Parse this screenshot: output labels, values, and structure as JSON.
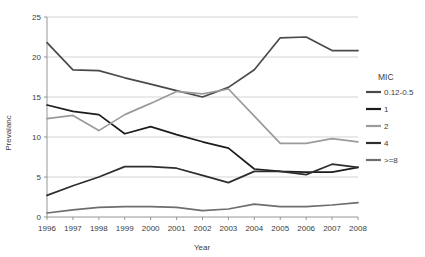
{
  "chart_data": {
    "type": "line",
    "title": "",
    "xlabel": "Year",
    "ylabel": "Prevalanc",
    "categories": [
      1996,
      1997,
      1998,
      1999,
      2000,
      2001,
      2002,
      2003,
      2004,
      2005,
      2006,
      2007,
      2008
    ],
    "x": [
      "1996",
      "1997",
      "1998",
      "1999",
      "2000",
      "2001",
      "2002",
      "2003",
      "2004",
      "2005",
      "2006",
      "2007",
      "2008"
    ],
    "ylim": [
      0,
      25
    ],
    "yticks": [
      0,
      5,
      10,
      15,
      20,
      25
    ],
    "ytick_labels": [
      "0",
      "5",
      "10",
      "15",
      "20",
      "25"
    ],
    "grid": "horizontal",
    "legend_position": "right",
    "legend_title": "MIC",
    "series": [
      {
        "name": "0.12-0.5",
        "color": "#4a4a4a",
        "values": [
          21.8,
          18.4,
          18.3,
          17.4,
          16.6,
          15.8,
          15.0,
          16.2,
          18.4,
          22.4,
          22.5,
          20.8,
          20.8
        ]
      },
      {
        "name": "1",
        "color": "#1c1c1c",
        "values": [
          14.0,
          13.2,
          12.8,
          10.4,
          11.3,
          10.3,
          9.4,
          8.6,
          6.0,
          5.7,
          5.6,
          5.6,
          6.2
        ]
      },
      {
        "name": "2",
        "color": "#9b9b9b",
        "values": [
          12.3,
          12.7,
          10.8,
          12.8,
          14.2,
          15.7,
          15.4,
          16.0,
          12.6,
          9.2,
          9.2,
          9.8,
          9.4
        ]
      },
      {
        "name": "4",
        "color": "#2e2e2e",
        "values": [
          2.7,
          3.9,
          5.0,
          6.3,
          6.3,
          6.1,
          5.2,
          4.3,
          5.7,
          5.7,
          5.3,
          6.6,
          6.2
        ]
      },
      {
        "name": ">=8",
        "color": "#6e6e6e",
        "values": [
          0.5,
          0.9,
          1.2,
          1.3,
          1.3,
          1.2,
          0.8,
          1.0,
          1.6,
          1.3,
          1.3,
          1.5,
          1.8
        ]
      }
    ]
  },
  "legend": {
    "title": "MIC",
    "items": [
      {
        "label": "0.12-0.5"
      },
      {
        "label": "1"
      },
      {
        "label": "2"
      },
      {
        "label": "4"
      },
      {
        "label": ">=8"
      }
    ]
  },
  "axes": {
    "x_title": "Year",
    "y_title": "Prevalanc"
  }
}
